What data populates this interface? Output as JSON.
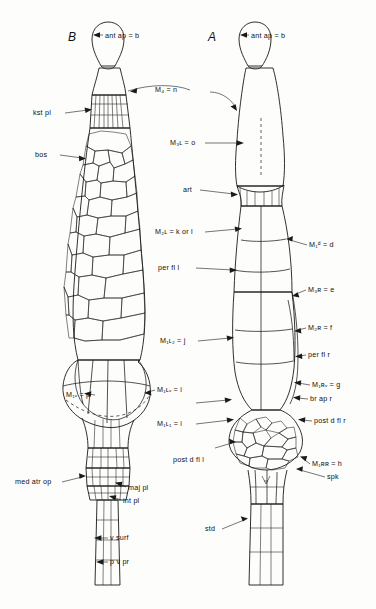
{
  "figure": {
    "panels": [
      {
        "id": "panel-b",
        "label": "B"
      },
      {
        "id": "panel-a",
        "label": "A"
      }
    ]
  },
  "labels_left": [
    {
      "key": "kst_pl",
      "text": "kst pl"
    },
    {
      "key": "bos",
      "text": "bos"
    },
    {
      "key": "m_iv_p",
      "text": "M₁ᵥ = p"
    },
    {
      "key": "med_atr_op",
      "text": "med atr op"
    },
    {
      "key": "maj_pl",
      "text": "maj pl"
    },
    {
      "key": "int_pl",
      "text": "int pl"
    },
    {
      "key": "v_surf",
      "text": "v surf"
    },
    {
      "key": "p_v_pr",
      "text": "p v pr"
    }
  ],
  "labels_center": [
    {
      "key": "ant_ap_b",
      "text": "ant ap = b"
    },
    {
      "key": "m_4_n",
      "text": "M₄ = n"
    },
    {
      "key": "m_3l_o",
      "text": "M₃ʟ = o"
    },
    {
      "key": "art",
      "text": "art"
    },
    {
      "key": "m_2l_k_or_l",
      "text": "M₂ʟ = k or l"
    },
    {
      "key": "per_fl_l",
      "text": "per fl l"
    },
    {
      "key": "m_1l2_j",
      "text": "M₁ʟ₂ = j"
    },
    {
      "key": "m_1lv_i",
      "text": "M₁ʟᵥ = i"
    },
    {
      "key": "m_1l1_i",
      "text": "M₁ʟ₁ = i"
    },
    {
      "key": "post_d_fl_l",
      "text": "post d fl l"
    }
  ],
  "labels_right": [
    {
      "key": "ant_ap_b_r",
      "text": "ant ap = b"
    },
    {
      "key": "m_1d_d",
      "text": "M₁ᵈ = d"
    },
    {
      "key": "m_3r_e",
      "text": "M₃ʀ = e"
    },
    {
      "key": "m_2r_f",
      "text": "M₂ʀ = f"
    },
    {
      "key": "per_fl_r",
      "text": "per fl r"
    },
    {
      "key": "m_1rv_g",
      "text": "M₁ʀᵥ = g"
    },
    {
      "key": "br_ap_r",
      "text": "br ap r"
    },
    {
      "key": "post_d_fl_r",
      "text": "post d fl r"
    },
    {
      "key": "m_1rr_h",
      "text": "M₁ʀʀ = h"
    },
    {
      "key": "spk",
      "text": "spk"
    },
    {
      "key": "std",
      "text": "std"
    }
  ]
}
